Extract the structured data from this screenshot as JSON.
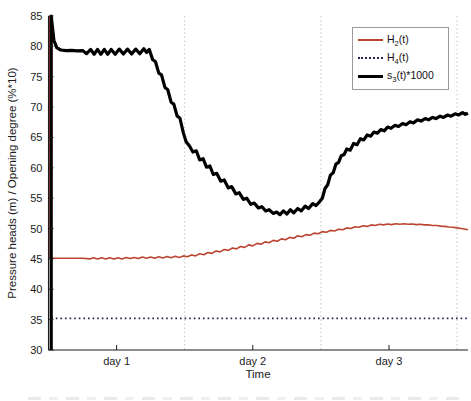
{
  "figure": {
    "background": "#ffffff"
  },
  "chart_data": {
    "type": "line",
    "title": "",
    "xlabel": "Time",
    "ylabel": "Pressure heads (m) / Opening degree (%*10)",
    "x_unit": "days",
    "xlim": [
      0,
      3.08
    ],
    "ylim": [
      30,
      85
    ],
    "y_ticks": [
      30,
      35,
      40,
      45,
      50,
      55,
      60,
      65,
      70,
      75,
      80,
      85
    ],
    "x_ticks": [
      {
        "t": 0.5,
        "label": "day 1"
      },
      {
        "t": 1.5,
        "label": "day 2"
      },
      {
        "t": 2.5,
        "label": "day 3"
      }
    ],
    "gridlines_x": [
      1,
      2,
      3
    ],
    "grid_on": true,
    "grid_color": "#b5b5b5",
    "axis_color": "#1c1c1c",
    "legend": {
      "position": "top-right",
      "entries": [
        {
          "name": "H2",
          "base": "H",
          "sub": "2",
          "suffix": "(t)",
          "color": "#bc4531",
          "style": "solid"
        },
        {
          "name": "H4",
          "base": "H",
          "sub": "4",
          "suffix": "(t)",
          "color": "#22224e",
          "style": "dotted"
        },
        {
          "name": "s3",
          "base": "s",
          "sub": "3",
          "suffix": "(t)*1000",
          "color": "#000000",
          "style": "solid"
        }
      ]
    },
    "series": [
      {
        "name": "H2-t",
        "color": "#bc4531",
        "width": 1.6,
        "style": "solid",
        "points": [
          [
            0.008,
            85
          ],
          [
            0.012,
            45.1
          ],
          [
            0.05,
            45.1
          ],
          [
            0.15,
            45.1
          ],
          [
            0.25,
            45.1
          ],
          [
            0.3,
            45.0
          ],
          [
            0.33,
            45.2
          ],
          [
            0.36,
            45.0
          ],
          [
            0.39,
            45.2
          ],
          [
            0.42,
            45.0
          ],
          [
            0.45,
            45.2
          ],
          [
            0.48,
            45.0
          ],
          [
            0.51,
            45.2
          ],
          [
            0.54,
            45.0
          ],
          [
            0.57,
            45.25
          ],
          [
            0.6,
            45.05
          ],
          [
            0.63,
            45.25
          ],
          [
            0.66,
            45.05
          ],
          [
            0.69,
            45.3
          ],
          [
            0.72,
            45.1
          ],
          [
            0.75,
            45.3
          ],
          [
            0.78,
            45.1
          ],
          [
            0.81,
            45.35
          ],
          [
            0.84,
            45.15
          ],
          [
            0.87,
            45.4
          ],
          [
            0.9,
            45.2
          ],
          [
            0.93,
            45.45
          ],
          [
            0.96,
            45.25
          ],
          [
            0.99,
            45.5
          ],
          [
            1.02,
            45.35
          ],
          [
            1.05,
            45.65
          ],
          [
            1.08,
            45.5
          ],
          [
            1.11,
            45.85
          ],
          [
            1.14,
            45.7
          ],
          [
            1.17,
            46.05
          ],
          [
            1.2,
            45.9
          ],
          [
            1.23,
            46.3
          ],
          [
            1.26,
            46.15
          ],
          [
            1.29,
            46.55
          ],
          [
            1.32,
            46.4
          ],
          [
            1.35,
            46.8
          ],
          [
            1.38,
            46.65
          ],
          [
            1.41,
            47.05
          ],
          [
            1.44,
            46.9
          ],
          [
            1.47,
            47.3
          ],
          [
            1.5,
            47.15
          ],
          [
            1.53,
            47.55
          ],
          [
            1.56,
            47.4
          ],
          [
            1.59,
            47.8
          ],
          [
            1.62,
            47.65
          ],
          [
            1.65,
            48.05
          ],
          [
            1.68,
            47.9
          ],
          [
            1.71,
            48.3
          ],
          [
            1.74,
            48.15
          ],
          [
            1.77,
            48.55
          ],
          [
            1.8,
            48.4
          ],
          [
            1.83,
            48.8
          ],
          [
            1.86,
            48.65
          ],
          [
            1.89,
            49.0
          ],
          [
            1.92,
            48.9
          ],
          [
            1.95,
            49.25
          ],
          [
            1.98,
            49.15
          ],
          [
            2.01,
            49.5
          ],
          [
            2.04,
            49.4
          ],
          [
            2.07,
            49.7
          ],
          [
            2.1,
            49.6
          ],
          [
            2.13,
            49.9
          ],
          [
            2.16,
            49.8
          ],
          [
            2.19,
            50.1
          ],
          [
            2.22,
            50.0
          ],
          [
            2.25,
            50.3
          ],
          [
            2.28,
            50.2
          ],
          [
            2.31,
            50.45
          ],
          [
            2.34,
            50.35
          ],
          [
            2.37,
            50.6
          ],
          [
            2.4,
            50.5
          ],
          [
            2.43,
            50.7
          ],
          [
            2.46,
            50.6
          ],
          [
            2.49,
            50.75
          ],
          [
            2.52,
            50.65
          ],
          [
            2.55,
            50.8
          ],
          [
            2.58,
            50.7
          ],
          [
            2.61,
            50.8
          ],
          [
            2.64,
            50.7
          ],
          [
            2.67,
            50.75
          ],
          [
            2.7,
            50.65
          ],
          [
            2.73,
            50.7
          ],
          [
            2.76,
            50.6
          ],
          [
            2.79,
            50.6
          ],
          [
            2.82,
            50.5
          ],
          [
            2.85,
            50.5
          ],
          [
            2.88,
            50.4
          ],
          [
            2.91,
            50.35
          ],
          [
            2.94,
            50.25
          ],
          [
            2.97,
            50.2
          ],
          [
            3.0,
            50.1
          ],
          [
            3.03,
            50.0
          ],
          [
            3.06,
            49.9
          ],
          [
            3.08,
            49.8
          ]
        ]
      },
      {
        "name": "H4-t",
        "color": "#22224e",
        "width": 1.8,
        "style": "dotted",
        "points": [
          [
            0.02,
            35.2
          ],
          [
            3.08,
            35.2
          ]
        ]
      },
      {
        "name": "s3-t-1000",
        "color": "#000000",
        "width": 3.2,
        "style": "solid",
        "points": [
          [
            0.02,
            30
          ],
          [
            0.02,
            85
          ],
          [
            0.04,
            81.0
          ],
          [
            0.06,
            79.8
          ],
          [
            0.09,
            79.4
          ],
          [
            0.13,
            79.3
          ],
          [
            0.17,
            79.35
          ],
          [
            0.21,
            79.25
          ],
          [
            0.25,
            79.3
          ],
          [
            0.28,
            78.8
          ],
          [
            0.31,
            79.5
          ],
          [
            0.335,
            78.7
          ],
          [
            0.36,
            79.5
          ],
          [
            0.385,
            78.7
          ],
          [
            0.41,
            79.5
          ],
          [
            0.435,
            78.7
          ],
          [
            0.46,
            79.5
          ],
          [
            0.49,
            78.7
          ],
          [
            0.52,
            79.55
          ],
          [
            0.55,
            78.75
          ],
          [
            0.58,
            79.55
          ],
          [
            0.61,
            78.75
          ],
          [
            0.64,
            79.55
          ],
          [
            0.67,
            78.8
          ],
          [
            0.7,
            79.6
          ],
          [
            0.72,
            79.0
          ],
          [
            0.74,
            79.5
          ],
          [
            0.765,
            77.8
          ],
          [
            0.785,
            77.5
          ],
          [
            0.81,
            75.6
          ],
          [
            0.83,
            75.3
          ],
          [
            0.855,
            73.2
          ],
          [
            0.875,
            72.9
          ],
          [
            0.9,
            70.8
          ],
          [
            0.92,
            70.5
          ],
          [
            0.945,
            68.5
          ],
          [
            0.965,
            68.2
          ],
          [
            0.99,
            65.8
          ],
          [
            1.01,
            64.3
          ],
          [
            1.035,
            63.6
          ],
          [
            1.06,
            62.6
          ],
          [
            1.085,
            62.8
          ],
          [
            1.11,
            61.3
          ],
          [
            1.135,
            61.5
          ],
          [
            1.16,
            60.1
          ],
          [
            1.185,
            60.3
          ],
          [
            1.21,
            58.9
          ],
          [
            1.235,
            59.1
          ],
          [
            1.265,
            57.8
          ],
          [
            1.29,
            58.0
          ],
          [
            1.32,
            56.7
          ],
          [
            1.345,
            56.9
          ],
          [
            1.375,
            55.7
          ],
          [
            1.4,
            55.9
          ],
          [
            1.43,
            54.8
          ],
          [
            1.455,
            55.0
          ],
          [
            1.485,
            54.0
          ],
          [
            1.51,
            54.2
          ],
          [
            1.54,
            53.4
          ],
          [
            1.565,
            53.6
          ],
          [
            1.595,
            52.9
          ],
          [
            1.62,
            53.1
          ],
          [
            1.65,
            52.5
          ],
          [
            1.675,
            52.7
          ],
          [
            1.7,
            52.3
          ],
          [
            1.725,
            52.9
          ],
          [
            1.75,
            52.4
          ],
          [
            1.775,
            53.1
          ],
          [
            1.8,
            52.6
          ],
          [
            1.83,
            53.3
          ],
          [
            1.855,
            52.9
          ],
          [
            1.885,
            53.7
          ],
          [
            1.91,
            53.3
          ],
          [
            1.94,
            54.1
          ],
          [
            1.965,
            53.8
          ],
          [
            1.99,
            54.4
          ],
          [
            2.01,
            55.0
          ],
          [
            2.03,
            56.6
          ],
          [
            2.05,
            57.2
          ],
          [
            2.07,
            58.8
          ],
          [
            2.09,
            59.2
          ],
          [
            2.11,
            60.6
          ],
          [
            2.13,
            60.9
          ],
          [
            2.15,
            62.0
          ],
          [
            2.17,
            62.2
          ],
          [
            2.19,
            63.1
          ],
          [
            2.215,
            62.9
          ],
          [
            2.24,
            64.0
          ],
          [
            2.265,
            63.8
          ],
          [
            2.29,
            64.8
          ],
          [
            2.315,
            64.6
          ],
          [
            2.34,
            65.4
          ],
          [
            2.365,
            65.2
          ],
          [
            2.39,
            65.9
          ],
          [
            2.415,
            65.7
          ],
          [
            2.44,
            66.3
          ],
          [
            2.465,
            66.1
          ],
          [
            2.49,
            66.7
          ],
          [
            2.515,
            66.5
          ],
          [
            2.545,
            67.0
          ],
          [
            2.57,
            66.8
          ],
          [
            2.6,
            67.3
          ],
          [
            2.625,
            67.1
          ],
          [
            2.655,
            67.6
          ],
          [
            2.68,
            67.4
          ],
          [
            2.71,
            67.9
          ],
          [
            2.735,
            67.7
          ],
          [
            2.765,
            68.1
          ],
          [
            2.79,
            67.9
          ],
          [
            2.82,
            68.3
          ],
          [
            2.845,
            68.1
          ],
          [
            2.875,
            68.5
          ],
          [
            2.9,
            68.3
          ],
          [
            2.93,
            68.7
          ],
          [
            2.955,
            68.5
          ],
          [
            2.985,
            68.9
          ],
          [
            3.01,
            68.7
          ],
          [
            3.04,
            69.1
          ],
          [
            3.06,
            68.8
          ],
          [
            3.08,
            69.0
          ]
        ]
      }
    ]
  }
}
